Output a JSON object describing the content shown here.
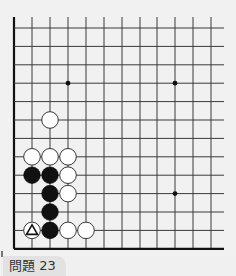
{
  "board": {
    "columns_x": [
      14,
      32,
      50,
      68,
      86,
      104,
      122,
      140,
      157,
      175,
      193,
      211
    ],
    "rows_y": [
      28,
      46.4,
      64.8,
      83.2,
      101.6,
      120,
      138.4,
      156.8,
      175.2,
      193.6,
      212,
      230.4,
      248.8
    ],
    "line_extent": {
      "top": 17,
      "right": 224
    },
    "edges": [
      "left",
      "bottom"
    ],
    "stone_radius": 8.3,
    "star_points": [
      {
        "col": 3,
        "row": 3
      },
      {
        "col": 9,
        "row": 3
      },
      {
        "col": 9,
        "row": 9
      }
    ],
    "stones": [
      {
        "color": "white",
        "col": 2,
        "row": 5
      },
      {
        "color": "white",
        "col": 1,
        "row": 7
      },
      {
        "color": "white",
        "col": 2,
        "row": 7
      },
      {
        "color": "white",
        "col": 3,
        "row": 7
      },
      {
        "color": "black",
        "col": 1,
        "row": 8
      },
      {
        "color": "black",
        "col": 2,
        "row": 8
      },
      {
        "color": "white",
        "col": 3,
        "row": 8
      },
      {
        "color": "black",
        "col": 2,
        "row": 9
      },
      {
        "color": "white",
        "col": 3,
        "row": 9
      },
      {
        "color": "black",
        "col": 2,
        "row": 10
      },
      {
        "color": "white",
        "col": 1,
        "row": 11,
        "mark": "triangle"
      },
      {
        "color": "black",
        "col": 2,
        "row": 11
      },
      {
        "color": "white",
        "col": 3,
        "row": 11
      },
      {
        "color": "white",
        "col": 4,
        "row": 11
      }
    ],
    "colors": {
      "background": "#f1f1f1",
      "line": "#3a3a3a",
      "edge": "#111111",
      "black_stone": "#111111",
      "white_stone": "#ffffff"
    }
  },
  "caption": {
    "label": "問題 23"
  }
}
